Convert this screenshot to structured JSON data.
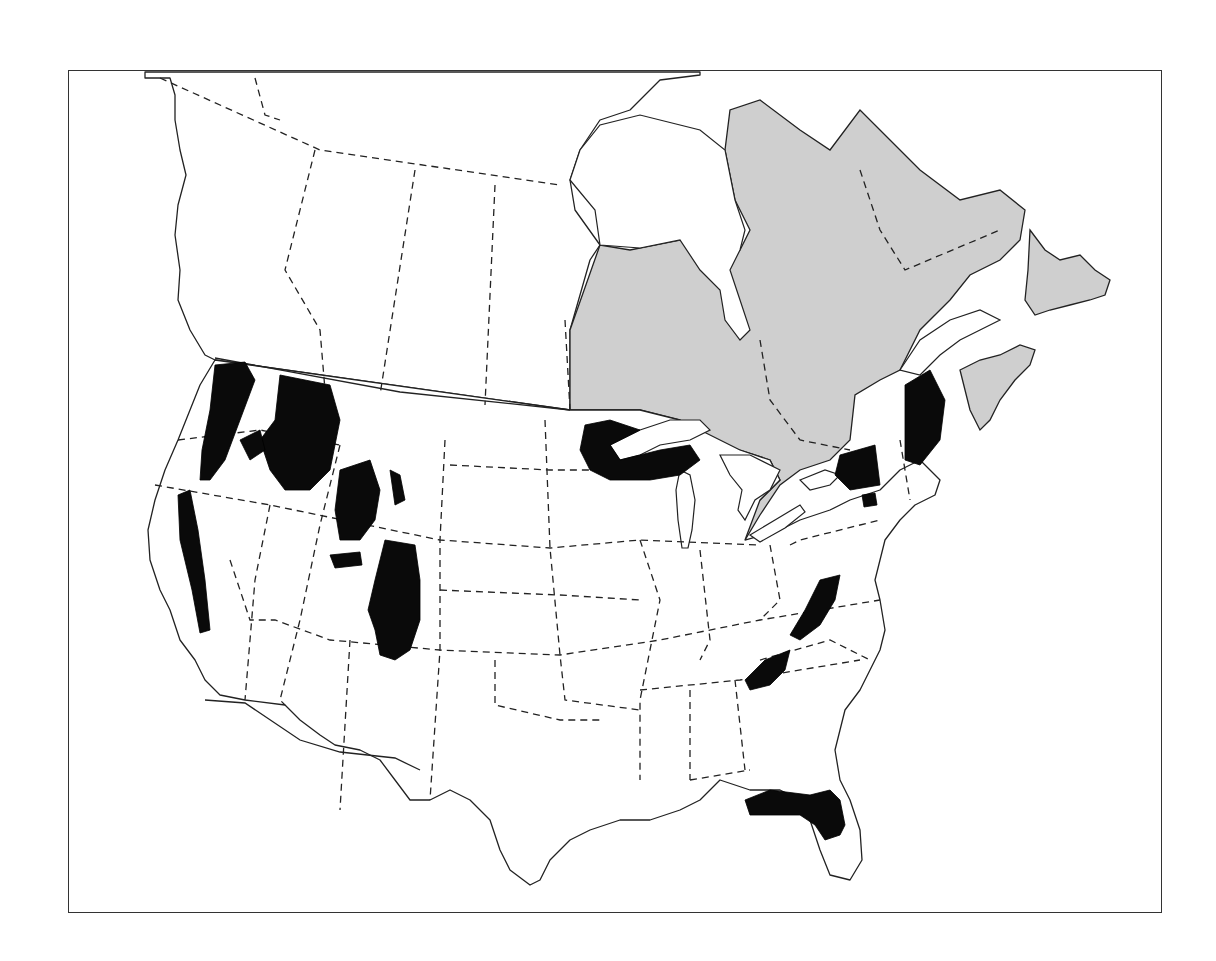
{
  "map": {
    "type": "distribution-map",
    "extent": "North America (Canada and contiguous United States)",
    "legend": [],
    "colors": {
      "primary_range": "#0a0a0a",
      "secondary_range": "#cfcfcf",
      "land": "#ffffff",
      "outline": "#222222"
    },
    "regions": {
      "secondary_range_shaded": [
        "Ontario",
        "Quebec",
        "Labrador",
        "Newfoundland",
        "New Brunswick",
        "Nova Scotia",
        "Prince Edward Island"
      ],
      "primary_range_black": [
        "Cascades (WA/OR)",
        "Sierra Nevada (CA)",
        "Northern Rockies (ID/MT)",
        "Wyoming Rockies",
        "Colorado Rockies",
        "Upper Great Lakes (MN/WI/MI)",
        "Adirondacks (NY)",
        "Maine",
        "Catskills (NY)",
        "Appalachians (VA/WV)",
        "Southern Appalachians (NC/TN)",
        "Florida"
      ]
    }
  }
}
